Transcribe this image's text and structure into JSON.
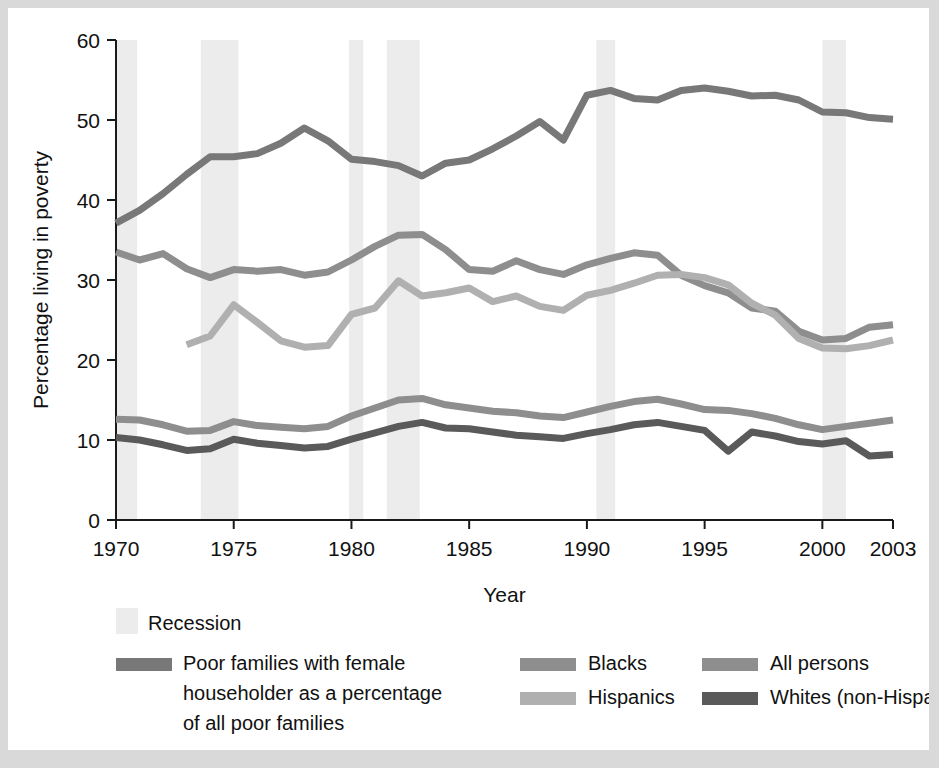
{
  "chart_data": {
    "type": "line",
    "title": "",
    "xlabel": "Year",
    "ylabel": "Percentage living in poverty",
    "xlim": [
      1970,
      2003
    ],
    "ylim": [
      0,
      60
    ],
    "grid": false,
    "legend_position": "bottom",
    "xticks": [
      "1970",
      "1975",
      "1980",
      "1985",
      "1990",
      "1995",
      "2000",
      "2003"
    ],
    "xtick_values": [
      1970,
      1975,
      1980,
      1985,
      1990,
      1995,
      2000,
      2003
    ],
    "yticks": [
      "0",
      "10",
      "20",
      "30",
      "40",
      "50",
      "60"
    ],
    "ytick_values": [
      0,
      10,
      20,
      30,
      40,
      50,
      60
    ],
    "x": [
      1970,
      1971,
      1972,
      1973,
      1974,
      1975,
      1976,
      1977,
      1978,
      1979,
      1980,
      1981,
      1982,
      1983,
      1984,
      1985,
      1986,
      1987,
      1988,
      1989,
      1990,
      1991,
      1992,
      1993,
      1994,
      1995,
      1996,
      1997,
      1998,
      1999,
      2000,
      2001,
      2002,
      2003
    ],
    "series": [
      {
        "name": "Poor families with female householder as a percentage of all poor families",
        "color": "#787878",
        "values": [
          37.1,
          38.7,
          40.8,
          43.2,
          45.4,
          45.4,
          45.8,
          47.1,
          49.0,
          47.4,
          45.1,
          44.8,
          44.3,
          43.0,
          44.6,
          45.0,
          46.4,
          48.0,
          49.8,
          47.5,
          53.1,
          53.7,
          52.7,
          52.5,
          53.7,
          54.0,
          53.6,
          53.0,
          53.1,
          52.5,
          51.0,
          50.9,
          50.3,
          50.1
        ]
      },
      {
        "name": "Blacks",
        "color": "#8e8e8e",
        "values": [
          33.5,
          32.5,
          33.3,
          31.4,
          30.3,
          31.3,
          31.1,
          31.3,
          30.6,
          31.0,
          32.5,
          34.2,
          35.6,
          35.7,
          33.8,
          31.3,
          31.1,
          32.4,
          31.3,
          30.7,
          31.9,
          32.7,
          33.4,
          33.1,
          30.6,
          29.3,
          28.4,
          26.5,
          26.1,
          23.6,
          22.5,
          22.7,
          24.1,
          24.4
        ]
      },
      {
        "name": "Hispanics",
        "color": "#b0b0b0",
        "values": [
          null,
          null,
          null,
          21.9,
          23.0,
          26.9,
          24.7,
          22.4,
          21.6,
          21.8,
          25.7,
          26.5,
          29.9,
          28.0,
          28.4,
          29.0,
          27.3,
          28.0,
          26.7,
          26.2,
          28.1,
          28.7,
          29.6,
          30.6,
          30.7,
          30.3,
          29.4,
          27.1,
          25.6,
          22.7,
          21.5,
          21.4,
          21.8,
          22.5
        ]
      },
      {
        "name": "All persons",
        "color": "#8e8e8e",
        "values": [
          12.6,
          12.5,
          11.9,
          11.1,
          11.2,
          12.3,
          11.8,
          11.6,
          11.4,
          11.7,
          13.0,
          14.0,
          15.0,
          15.2,
          14.4,
          14.0,
          13.6,
          13.4,
          13.0,
          12.8,
          13.5,
          14.2,
          14.8,
          15.1,
          14.5,
          13.8,
          13.7,
          13.3,
          12.7,
          11.9,
          11.3,
          11.7,
          12.1,
          12.5
        ]
      },
      {
        "name": "Whites (non-Hispanic)",
        "color": "#5a5a5a",
        "values": [
          10.3,
          10.0,
          9.4,
          8.7,
          8.9,
          10.1,
          9.6,
          9.3,
          9.0,
          9.2,
          10.1,
          10.9,
          11.7,
          12.2,
          11.5,
          11.4,
          11.0,
          10.6,
          10.4,
          10.2,
          10.8,
          11.3,
          11.9,
          12.2,
          11.7,
          11.2,
          8.6,
          11.0,
          10.5,
          9.8,
          9.5,
          9.9,
          8.0,
          8.2
        ]
      }
    ],
    "recessions": [
      {
        "start": 1969.9,
        "end": 1970.9
      },
      {
        "start": 1973.6,
        "end": 1975.2
      },
      {
        "start": 1979.9,
        "end": 1980.5
      },
      {
        "start": 1981.5,
        "end": 1982.9
      },
      {
        "start": 1990.4,
        "end": 1991.2
      },
      {
        "start": 2000.0,
        "end": 2001.0
      }
    ],
    "recession_color": "#ececec"
  },
  "axis": {
    "y_title": "Percentage living in poverty",
    "x_title": "Year"
  },
  "legend": {
    "recession_label": "Recession",
    "entries": [
      {
        "label": "Poor families with female householder as a percentage of all poor families",
        "line1": "Poor families with female",
        "line2": "householder as a percentage",
        "line3": "of all poor families",
        "color": "#787878"
      },
      {
        "label": "Blacks",
        "color": "#8e8e8e"
      },
      {
        "label": "Hispanics",
        "color": "#b0b0b0"
      },
      {
        "label": "All persons",
        "color": "#8e8e8e"
      },
      {
        "label": "Whites (non-Hispanic)",
        "color": "#5a5a5a"
      }
    ]
  }
}
